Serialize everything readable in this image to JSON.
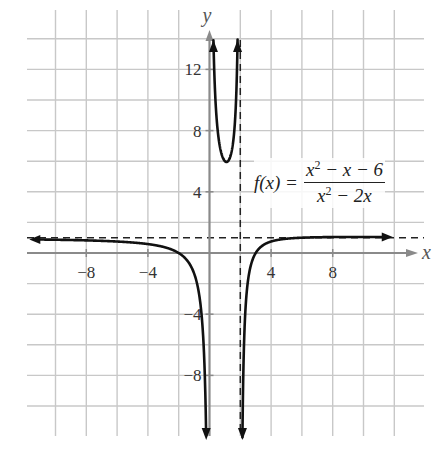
{
  "chart_data": {
    "type": "line",
    "title": "",
    "function": "f(x) = (x^2 - x - 6)/(x^2 - 2x)",
    "formula": {
      "lhs": "f(x) =",
      "numerator": "x² − x − 6",
      "denominator": "x² − 2x"
    },
    "xlabel": "x",
    "ylabel": "y",
    "xlim": [
      -12,
      13
    ],
    "ylim": [
      -13,
      15
    ],
    "grid": true,
    "grid_step": 2,
    "x_ticks": [
      -8,
      -4,
      4,
      8
    ],
    "x_tick_labels": [
      "−8",
      "−4",
      "4",
      "8"
    ],
    "y_ticks": [
      12,
      8,
      4,
      -4,
      -8
    ],
    "y_tick_labels": [
      "12",
      "8",
      "4",
      "−4",
      "−8"
    ],
    "asymptotes": {
      "vertical": [
        2
      ],
      "horizontal": [
        1
      ],
      "note": "x = 0 is also a vertical asymptote (coincides with the y-axis)"
    },
    "series": [
      {
        "name": "left branch (x<0)",
        "points": [
          [
            -11.5,
            1.09
          ],
          [
            -8,
            1.15
          ],
          [
            -6,
            1.22
          ],
          [
            -4,
            1.42
          ],
          [
            -3,
            1.6
          ],
          [
            -2,
            2.0
          ],
          [
            -1,
            2.33
          ],
          [
            -0.5,
            4.2
          ],
          [
            -0.3,
            7.6
          ],
          [
            -0.2,
            11.0
          ],
          [
            -0.1,
            21
          ]
        ]
      },
      {
        "name": "middle branch (0<x<2)",
        "points": [
          [
            0.15,
            21
          ],
          [
            0.25,
            13.5
          ],
          [
            0.5,
            9.0
          ],
          [
            0.8,
            7.3
          ],
          [
            1.0,
            6.0
          ],
          [
            1.2,
            7.3
          ],
          [
            1.5,
            9.0
          ],
          [
            1.75,
            13.5
          ],
          [
            1.85,
            21
          ]
        ]
      },
      {
        "name": "right branch (x>2)",
        "points": [
          [
            2.1,
            -9.5
          ],
          [
            2.2,
            -5.7
          ],
          [
            2.5,
            -2.6
          ],
          [
            3,
            -1.0
          ],
          [
            4,
            0.25
          ],
          [
            6,
            0.67
          ],
          [
            8,
            0.83
          ],
          [
            11,
            0.91
          ]
        ]
      }
    ],
    "legend": null
  }
}
